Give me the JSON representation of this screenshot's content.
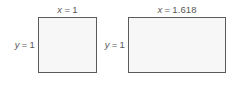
{
  "figure": {
    "background_color": "#ffffff",
    "rect_border_color": "#5b5b5b",
    "rect_fill_color": "#f7f7f7",
    "label_text_color": "#585858"
  },
  "rectangles": [
    {
      "name": "unit-square",
      "width_label": {
        "variable": "x",
        "equals": "=",
        "value": "1",
        "full": "x = 1"
      },
      "height_label": {
        "variable": "y",
        "equals": "=",
        "value": "1",
        "full": "y = 1"
      }
    },
    {
      "name": "golden-rectangle",
      "width_label": {
        "variable": "x",
        "equals": "=",
        "value": "1.618",
        "full": "x = 1.618"
      },
      "height_label": {
        "variable": "y",
        "equals": "=",
        "value": "1",
        "full": "y = 1"
      }
    }
  ]
}
